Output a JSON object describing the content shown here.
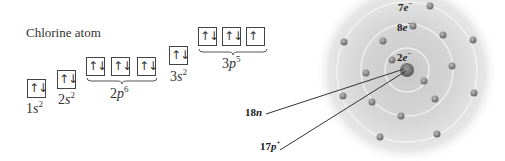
{
  "title": "Chlorine atom",
  "orbitals": [
    {
      "id": "1s",
      "n": "1",
      "sub": "s",
      "electrons": "2",
      "boxes": [
        "↑↓"
      ]
    },
    {
      "id": "2s",
      "n": "2",
      "sub": "s",
      "electrons": "2",
      "boxes": [
        "↑↓"
      ]
    },
    {
      "id": "2p",
      "n": "2",
      "sub": "p",
      "electrons": "6",
      "boxes": [
        "↑↓",
        "↑↓",
        "↑↓"
      ]
    },
    {
      "id": "3s",
      "n": "3",
      "sub": "s",
      "electrons": "2",
      "boxes": [
        "↑↓"
      ]
    },
    {
      "id": "3p",
      "n": "3",
      "sub": "p",
      "electrons": "5",
      "boxes": [
        "↑↓",
        "↑↓",
        "↑"
      ]
    }
  ],
  "atom": {
    "shells": [
      {
        "count": "2",
        "unit": "e",
        "charge": "−"
      },
      {
        "count": "8",
        "unit": "e",
        "charge": "−"
      },
      {
        "count": "7",
        "unit": "e",
        "charge": "−"
      }
    ],
    "neutrons": {
      "count": "18",
      "unit": "n"
    },
    "protons": {
      "count": "17",
      "unit": "p",
      "charge": "+"
    }
  }
}
